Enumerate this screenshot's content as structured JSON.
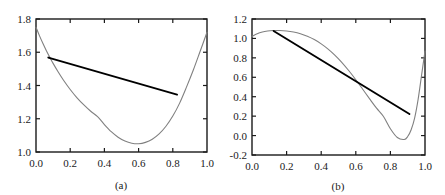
{
  "figure": {
    "background_color": "#ffffff",
    "curve_color": "#808080",
    "chord_color": "#000000",
    "axis_color": "#1a1a1a",
    "text_color": "#1a1a1a"
  },
  "chart_data": [
    {
      "type": "line",
      "panel_id": "a",
      "caption": "(a)",
      "title": "",
      "xlabel": "",
      "ylabel": "",
      "xlim": [
        0.0,
        1.0
      ],
      "ylim": [
        1.0,
        1.8
      ],
      "grid": false,
      "legend": "none",
      "xticks": [
        0.0,
        0.2,
        0.4,
        0.6,
        0.8,
        1.0
      ],
      "xtick_labels": [
        "0.0",
        "0.2",
        "0.4",
        "0.6",
        "0.8",
        "1.0"
      ],
      "yticks": [
        1.0,
        1.2,
        1.4,
        1.6,
        1.8
      ],
      "ytick_labels": [
        "1.0",
        "1.2",
        "1.4",
        "1.6",
        "1.8"
      ],
      "series": [
        {
          "name": "curve",
          "style": "solid-gray",
          "x": [
            0.0,
            0.02,
            0.04,
            0.06,
            0.08,
            0.1,
            0.13,
            0.16,
            0.2,
            0.24,
            0.28,
            0.32,
            0.36,
            0.4,
            0.44,
            0.48,
            0.52,
            0.56,
            0.6,
            0.64,
            0.68,
            0.72,
            0.76,
            0.8,
            0.84,
            0.88,
            0.92,
            0.96,
            1.0
          ],
          "y": [
            1.75,
            1.7,
            1.654,
            1.611,
            1.571,
            1.533,
            1.481,
            1.433,
            1.376,
            1.326,
            1.283,
            1.245,
            1.213,
            1.165,
            1.122,
            1.089,
            1.066,
            1.053,
            1.05,
            1.058,
            1.077,
            1.109,
            1.155,
            1.216,
            1.294,
            1.39,
            1.493,
            1.606,
            1.72
          ]
        },
        {
          "name": "chord",
          "style": "solid-black",
          "x": [
            0.072,
            0.825
          ],
          "y": [
            1.568,
            1.345
          ]
        }
      ]
    },
    {
      "type": "line",
      "panel_id": "b",
      "caption": "(b)",
      "title": "",
      "xlabel": "",
      "ylabel": "",
      "xlim": [
        0.0,
        1.0
      ],
      "ylim": [
        -0.2,
        1.2
      ],
      "grid": false,
      "legend": "none",
      "xticks": [
        0.0,
        0.2,
        0.4,
        0.6,
        0.8,
        1.0
      ],
      "xtick_labels": [
        "0.0",
        "0.2",
        "0.4",
        "0.6",
        "0.8",
        "1.0"
      ],
      "yticks": [
        -0.2,
        0.0,
        0.2,
        0.4,
        0.6,
        0.8,
        1.0,
        1.2
      ],
      "ytick_labels": [
        "-0.2",
        "0.0",
        "0.2",
        "0.4",
        "0.6",
        "0.8",
        "1.0",
        "1.2"
      ],
      "series": [
        {
          "name": "curve",
          "style": "solid-gray",
          "x": [
            0.0,
            0.03,
            0.06,
            0.09,
            0.12,
            0.16,
            0.2,
            0.24,
            0.28,
            0.32,
            0.36,
            0.4,
            0.44,
            0.48,
            0.52,
            0.56,
            0.6,
            0.64,
            0.68,
            0.72,
            0.76,
            0.8,
            0.84,
            0.88,
            0.9,
            0.92,
            0.94,
            0.96,
            0.98,
            1.0
          ],
          "y": [
            1.02,
            1.048,
            1.066,
            1.076,
            1.081,
            1.082,
            1.077,
            1.066,
            1.048,
            1.022,
            0.988,
            0.944,
            0.89,
            0.826,
            0.752,
            0.667,
            0.575,
            0.477,
            0.378,
            0.282,
            0.196,
            0.07,
            -0.02,
            -0.04,
            -0.01,
            0.06,
            0.18,
            0.37,
            0.62,
            0.87
          ]
        },
        {
          "name": "chord",
          "style": "solid-black",
          "x": [
            0.125,
            0.91
          ],
          "y": [
            1.076,
            0.222
          ]
        }
      ]
    }
  ]
}
